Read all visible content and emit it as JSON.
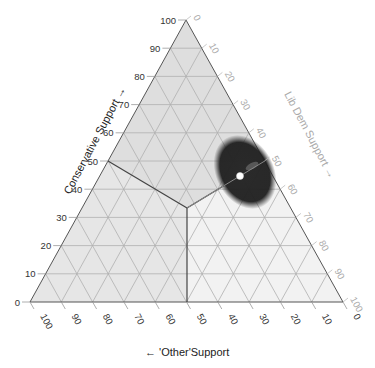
{
  "chart_data": {
    "type": "scatter",
    "subtype": "ternary",
    "title": "",
    "axes": {
      "conservative": {
        "label": "Conservative Support →",
        "ticks": [
          0,
          10,
          20,
          30,
          40,
          50,
          60,
          70,
          80,
          90,
          100
        ],
        "position": "left",
        "direction": "bottom-to-apex"
      },
      "lib_dem": {
        "label": "Lib Dem Support →",
        "ticks": [
          0,
          10,
          20,
          30,
          40,
          50,
          60,
          70,
          80,
          90,
          100
        ],
        "position": "right",
        "direction": "apex-to-bottom-right"
      },
      "other": {
        "label": "← 'Other'Support",
        "ticks": [
          100,
          90,
          80,
          70,
          60,
          50,
          40,
          30,
          20,
          10,
          0
        ],
        "position": "bottom",
        "direction": "right-to-left"
      }
    },
    "grid": true,
    "gridStep": 10,
    "regions": [
      {
        "name": "Conservative",
        "fill": "#dcdcdc",
        "boundary_vertices": [
          [
            100,
            0,
            0
          ],
          [
            50,
            50,
            0
          ],
          [
            33.3,
            33.3,
            33.3
          ],
          [
            0,
            50,
            50
          ]
        ]
      },
      {
        "name": "Lib Dem",
        "fill": "#ececec"
      },
      {
        "name": "Other",
        "fill": "#f7f7f7"
      }
    ],
    "boundaries": [
      {
        "from": {
          "conservative": 50,
          "lib_dem": 0,
          "other": 50
        },
        "to": {
          "conservative": 33.3,
          "lib_dem": 33.3,
          "other": 33.3
        }
      },
      {
        "from": {
          "conservative": 33.3,
          "lib_dem": 33.3,
          "other": 33.3
        },
        "to": {
          "conservative": 0,
          "lib_dem": 50,
          "other": 50
        }
      },
      {
        "from": {
          "conservative": 33.3,
          "lib_dem": 33.3,
          "other": 33.3
        },
        "to": {
          "conservative": 50,
          "lib_dem": 50,
          "other": 0
        }
      }
    ],
    "points": [
      {
        "label": "estimate",
        "conservative": 44.7,
        "lib_dem": 44.7,
        "other": 10.6,
        "color": "#ffffff"
      }
    ],
    "uncertainty_cloud": {
      "center": {
        "conservative": 46,
        "lib_dem": 45,
        "other": 9
      },
      "color": "#1a1a1a"
    }
  }
}
